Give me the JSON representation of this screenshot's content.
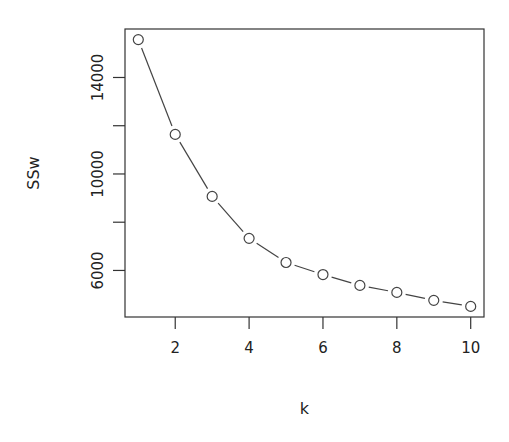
{
  "chart_data": {
    "type": "line",
    "title": "",
    "xlabel": "k",
    "ylabel": "SSw",
    "x": [
      1,
      2,
      3,
      4,
      5,
      6,
      7,
      8,
      9,
      10
    ],
    "series": [
      {
        "name": "SSw",
        "values": [
          15570,
          11640,
          9070,
          7330,
          6330,
          5830,
          5380,
          5090,
          4760,
          4510
        ]
      }
    ],
    "xticks": [
      2,
      4,
      6,
      8,
      10
    ],
    "yticks": [
      6000,
      8000,
      10000,
      12000,
      14000
    ],
    "ytick_labels": [
      "6000",
      "",
      "10000",
      "",
      "14000"
    ],
    "xlim": [
      0.64,
      10.36
    ],
    "ylim": [
      4070,
      16010
    ],
    "grid": false,
    "legend": null,
    "style": {
      "marker": "open-circle",
      "line": "broken-line (type b)",
      "color": "#333333"
    }
  },
  "labels": {
    "xlabel": "k",
    "ylabel": "SSw"
  }
}
